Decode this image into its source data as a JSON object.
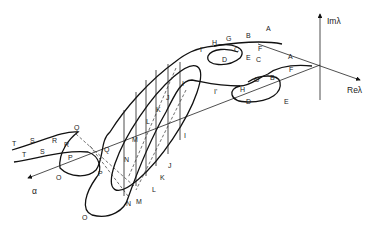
{
  "axes": {
    "imaginary": "Imλ",
    "real": "Reλ",
    "parameter": "α"
  },
  "upper_track_labels": [
    "T",
    "S",
    "R",
    "Q",
    "P",
    "O",
    "N",
    "M",
    "L",
    "K",
    "J",
    "I",
    "I'",
    "H",
    "G",
    "B",
    "A",
    "F",
    "E",
    "D",
    "C"
  ],
  "labels": {
    "A1": "A",
    "A2": "A",
    "B1": "B",
    "B2": "B",
    "C1": "C",
    "C2": "C",
    "D1": "D",
    "D2": "D",
    "E1": "E",
    "E2": "E",
    "F1": "F",
    "F2": "F",
    "G1": "G",
    "G2": "G",
    "H1": "H",
    "H2": "H",
    "I1": "I",
    "I2": "I",
    "Ip1": "I'",
    "Ip2": "I'",
    "J1": "J",
    "J2": "J",
    "K1": "K",
    "K2": "K",
    "L1": "L",
    "L2": "L",
    "M1": "M",
    "M2": "M",
    "N1": "N",
    "N2": "N",
    "O1": "O",
    "O2": "O",
    "P1": "P",
    "P2": "P",
    "Q1": "Q",
    "Q2": "Q",
    "R1": "R",
    "R2": "R",
    "S1": "S",
    "S2": "S",
    "T1": "T",
    "T2": "T"
  }
}
